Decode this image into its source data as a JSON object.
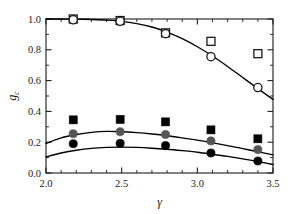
{
  "chart_data": {
    "type": "scatter",
    "title": "",
    "xlabel": "γ",
    "ylabel": "g_c",
    "ylabel_main": "g",
    "ylabel_sub": "c",
    "xlim": [
      2.0,
      3.5
    ],
    "ylim": [
      0.0,
      1.0
    ],
    "grid": false,
    "legend": "none",
    "x_ticks": [
      "2.0",
      "2.5",
      "3.0",
      "3.5"
    ],
    "x_tick_values": [
      2.0,
      2.5,
      3.0,
      3.5
    ],
    "x_minor_ticks": [
      2.1,
      2.2,
      2.3,
      2.4,
      2.6,
      2.7,
      2.8,
      2.9,
      3.1,
      3.2,
      3.3,
      3.4
    ],
    "y_ticks": [
      "0.0",
      "0.2",
      "0.4",
      "0.6",
      "0.8",
      "1.0"
    ],
    "y_tick_values": [
      0.0,
      0.2,
      0.4,
      0.6,
      0.8,
      1.0
    ],
    "y_minor_ticks": [
      0.1,
      0.3,
      0.5,
      0.7,
      0.9
    ],
    "x": [
      2.18,
      2.49,
      2.79,
      3.09,
      3.4
    ],
    "series": [
      {
        "name": "open-squares",
        "marker": "open-square",
        "color": "#1a1a1a",
        "fill": "none",
        "values": [
          1.0,
          0.99,
          0.91,
          0.855,
          0.775
        ]
      },
      {
        "name": "open-circles",
        "marker": "open-circle",
        "color": "#1a1a1a",
        "fill": "none",
        "values": [
          0.995,
          0.985,
          0.905,
          0.755,
          0.555
        ]
      },
      {
        "name": "filled-squares",
        "marker": "filled-square",
        "color": "#000000",
        "fill": "#000000",
        "values": [
          0.345,
          0.348,
          0.332,
          0.28,
          0.222
        ]
      },
      {
        "name": "gray-circles",
        "marker": "filled-circle",
        "color": "#555555",
        "fill": "#555555",
        "values": [
          0.255,
          0.268,
          0.25,
          0.208,
          0.152
        ]
      },
      {
        "name": "black-circles",
        "marker": "filled-circle",
        "color": "#000000",
        "fill": "#000000",
        "values": [
          0.19,
          0.192,
          0.178,
          0.13,
          0.078
        ]
      }
    ],
    "curves": [
      {
        "name": "upper-curve",
        "color": "#000000",
        "points_x": [
          2.0,
          2.1,
          2.2,
          2.3,
          2.4,
          2.5,
          2.6,
          2.7,
          2.8,
          2.9,
          3.0,
          3.1,
          3.2,
          3.3,
          3.4,
          3.5
        ],
        "points_y": [
          1.0,
          1.0,
          0.999,
          0.997,
          0.993,
          0.985,
          0.97,
          0.948,
          0.915,
          0.872,
          0.82,
          0.76,
          0.692,
          0.62,
          0.548,
          0.478
        ]
      },
      {
        "name": "middle-curve",
        "color": "#000000",
        "points_x": [
          2.0,
          2.1,
          2.2,
          2.3,
          2.4,
          2.5,
          2.6,
          2.7,
          2.8,
          2.9,
          3.0,
          3.1,
          3.2,
          3.3,
          3.4,
          3.5
        ],
        "points_y": [
          0.192,
          0.228,
          0.25,
          0.264,
          0.27,
          0.268,
          0.262,
          0.253,
          0.242,
          0.228,
          0.213,
          0.196,
          0.178,
          0.158,
          0.138,
          0.118
        ]
      },
      {
        "name": "lower-curve",
        "color": "#000000",
        "points_x": [
          2.0,
          2.1,
          2.2,
          2.3,
          2.4,
          2.5,
          2.6,
          2.7,
          2.8,
          2.9,
          3.0,
          3.1,
          3.2,
          3.3,
          3.4,
          3.5
        ],
        "points_y": [
          0.105,
          0.13,
          0.148,
          0.16,
          0.166,
          0.168,
          0.166,
          0.161,
          0.154,
          0.145,
          0.135,
          0.122,
          0.108,
          0.092,
          0.074,
          0.055
        ]
      }
    ]
  }
}
